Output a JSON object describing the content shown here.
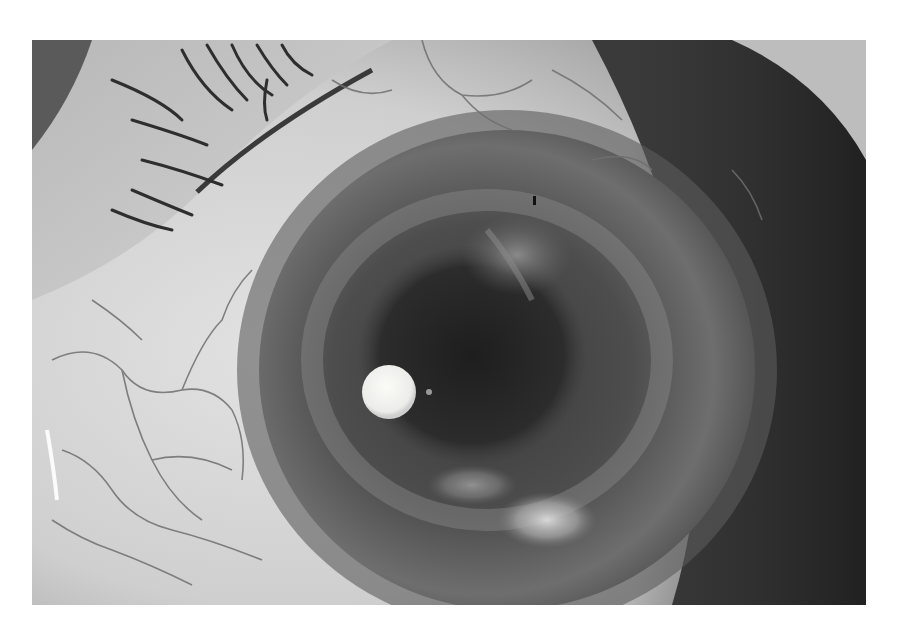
{
  "image": {
    "subject": "slit-lamp photograph of an eye",
    "mode": "grayscale",
    "frame": {
      "x": 32,
      "y": 40,
      "width": 834,
      "height": 565
    },
    "background": "#ffffff",
    "features": [
      {
        "name": "upper-eyelid-with-lashes",
        "region": "top-left"
      },
      {
        "name": "bulbar-conjunctiva-with-vessels",
        "region": "left and top"
      },
      {
        "name": "cornea",
        "center": [
          505,
          360
        ],
        "radius": 250
      },
      {
        "name": "pupil",
        "center": [
          470,
          340
        ]
      },
      {
        "name": "corneal-light-reflex",
        "center": [
          389,
          392
        ],
        "radius": 27
      },
      {
        "name": "inferior-white-infiltrate",
        "center": [
          545,
          520
        ]
      },
      {
        "name": "superior-hazy-opacity",
        "center": [
          515,
          245
        ]
      }
    ],
    "colors": {
      "sclera": "#d8d8d8",
      "cornea": "#5a5a5a",
      "pupil": "#262626",
      "reflex": "#f4f4f0",
      "shadow": "#2e2e2e",
      "vessel": "#6a6a6a"
    }
  }
}
